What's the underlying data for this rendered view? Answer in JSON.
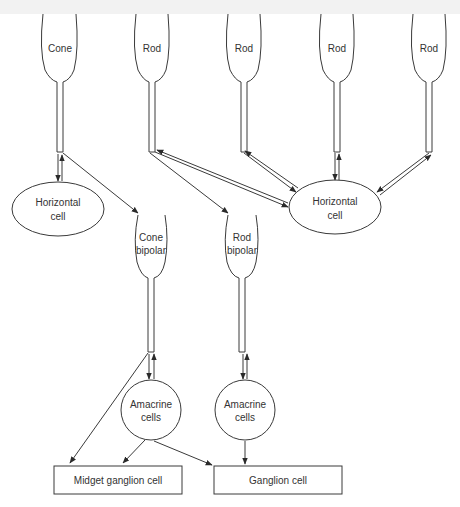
{
  "diagram": {
    "photoreceptors": [
      {
        "id": "cone",
        "label": "Cone"
      },
      {
        "id": "rod1",
        "label": "Rod"
      },
      {
        "id": "rod2",
        "label": "Rod"
      },
      {
        "id": "rod3",
        "label": "Rod"
      },
      {
        "id": "rod4",
        "label": "Rod"
      }
    ],
    "horizontal_left": {
      "line1": "Horizontal",
      "line2": "cell"
    },
    "horizontal_right": {
      "line1": "Horizontal",
      "line2": "cell"
    },
    "cone_bipolar": {
      "line1": "Cone",
      "line2": "bipolar"
    },
    "rod_bipolar": {
      "line1": "Rod",
      "line2": "bipolar"
    },
    "amacrine_left": {
      "line1": "Amacrine",
      "line2": "cells"
    },
    "amacrine_right": {
      "line1": "Amacrine",
      "line2": "cells"
    },
    "midget_ganglion": {
      "label": "Midget ganglion cell"
    },
    "ganglion": {
      "label": "Ganglion cell"
    },
    "connections": [
      {
        "from": "Cone",
        "to": "Horizontal cell (left)",
        "bidirectional": true
      },
      {
        "from": "Cone",
        "to": "Cone bipolar"
      },
      {
        "from": "Rod (1)",
        "to": "Rod bipolar"
      },
      {
        "from": "Rod (1)",
        "to": "Horizontal cell (right)",
        "bidirectional": true
      },
      {
        "from": "Rod (2)",
        "to": "Horizontal cell (right)",
        "bidirectional": true
      },
      {
        "from": "Rod (3)",
        "to": "Horizontal cell (right)",
        "bidirectional": true
      },
      {
        "from": "Rod (4)",
        "to": "Horizontal cell (right)",
        "bidirectional": true
      },
      {
        "from": "Cone bipolar",
        "to": "Amacrine cells (left)",
        "bidirectional": true
      },
      {
        "from": "Cone bipolar",
        "to": "Midget ganglion cell"
      },
      {
        "from": "Rod bipolar",
        "to": "Amacrine cells (right)",
        "bidirectional": true
      },
      {
        "from": "Amacrine cells (left)",
        "to": "Midget ganglion cell"
      },
      {
        "from": "Amacrine cells (left)",
        "to": "Ganglion cell"
      },
      {
        "from": "Amacrine cells (right)",
        "to": "Ganglion cell"
      }
    ]
  }
}
